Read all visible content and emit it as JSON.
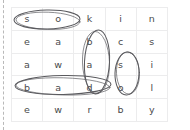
{
  "page": {
    "cut_line": "dashed-vertical-left-margin"
  },
  "grid": {
    "rows": 5,
    "columns": 5,
    "border_color": "#ececed",
    "letter_color": "#4a4a4c",
    "letters": [
      [
        "s",
        "o",
        "k",
        "i",
        "n"
      ],
      [
        "e",
        "a",
        "b",
        "c",
        "s"
      ],
      [
        "a",
        "w",
        "a",
        "s",
        "i"
      ],
      [
        "b",
        "a",
        "d",
        "o",
        "l"
      ],
      [
        "e",
        "w",
        "r",
        "b",
        "y"
      ]
    ]
  },
  "annotations": {
    "ink_color": "#5a5a5e",
    "circled_words": [
      {
        "word": "so",
        "orientation": "horizontal",
        "row": 1,
        "columns": [
          1,
          2
        ],
        "letters": [
          "s",
          "o"
        ]
      },
      {
        "word": "bad",
        "orientation": "vertical",
        "column": 3,
        "rows": [
          2,
          3,
          4
        ],
        "letters": [
          "b",
          "a",
          "d"
        ]
      },
      {
        "word": "so",
        "orientation": "vertical",
        "column": 4,
        "rows": [
          3,
          4
        ],
        "letters": [
          "s",
          "o"
        ]
      },
      {
        "word": "bad",
        "orientation": "horizontal",
        "row": 4,
        "columns": [
          1,
          2,
          3
        ],
        "letters": [
          "b",
          "a",
          "d"
        ]
      }
    ]
  }
}
